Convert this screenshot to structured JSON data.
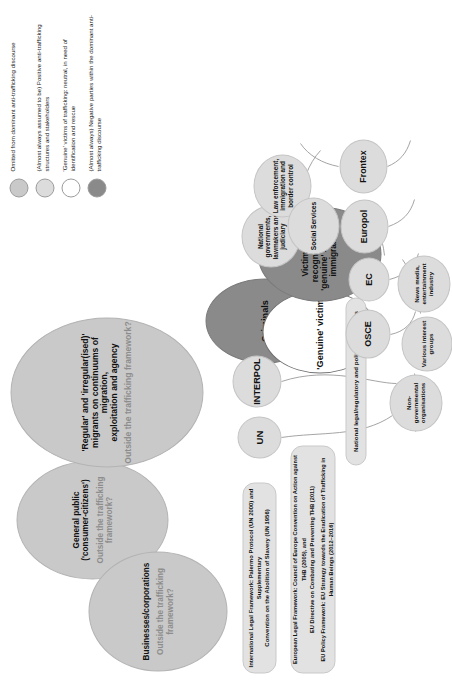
{
  "diagram": {
    "outside_nodes": [
      {
        "id": "general-public",
        "title": "General public\n('consumer-citizens')",
        "title_line1": "General public",
        "title_line2": "('consumer-citizens')",
        "subtitle_line1": "Outside the trafficking",
        "subtitle_line2": "framework?"
      },
      {
        "id": "businesses",
        "title_line1": "Businesses/corporations",
        "title_line2": "",
        "subtitle_line1": "Outside the trafficking",
        "subtitle_line2": "framework?"
      },
      {
        "id": "migrants",
        "title_line1": "'Regular' and 'irregular(ised)'",
        "title_line2": "migrants on continuums of migration,",
        "title_line3": "exploitation and agency",
        "subtitle_line1": "Outside the trafficking framework?"
      }
    ],
    "actor_nodes": {
      "criminals": "Criminals",
      "genuine_victims": "'Genuine' victims",
      "not_recognised_line1": "Victims not recognised as",
      "not_recognised_line2": "'genuine' = 'illegal'",
      "not_recognised_line3": "immigrants"
    },
    "framework_boxes": {
      "international_line1": "International Legal Framework: Palermo Protocol (UN 2000) and Supplementary",
      "international_line2": "Convention on the Abolition of Slavery (UN 1956)",
      "european_line1": "European Legal Framework: Council of Europe Convention on Action against THB (2005), and",
      "european_line2": "EU Directive on Combating and Preventing THB (2011)",
      "european_line3": "EU Policy Framework: EU Strategy towards the Eradication of Trafficking in Human Beings (2012–2016)",
      "national": "National legal/regulatory and policy frameworks"
    },
    "international_bodies": [
      {
        "id": "un",
        "label": "UN"
      },
      {
        "id": "interpol",
        "label": "INTERPOL"
      }
    ],
    "european_bodies": [
      {
        "id": "osce",
        "label": "OSCE"
      },
      {
        "id": "ec",
        "label": "EC"
      },
      {
        "id": "europol",
        "label": "Europol"
      },
      {
        "id": "frontex",
        "label": "Frontex"
      }
    ],
    "national_actors": [
      {
        "id": "national-governments",
        "line1": "National",
        "line2": "governments,",
        "line3": "lawmakers and",
        "line4": "judiciary"
      },
      {
        "id": "law-enforcement",
        "line1": "Law enforcement,",
        "line2": "immigration and",
        "line3": "border control"
      },
      {
        "id": "social-services",
        "line1": "Social Services",
        "line2": "",
        "line3": ""
      }
    ],
    "civil_actors": [
      {
        "id": "ngo",
        "line1": "Non-governmental",
        "line2": "organisations",
        "line3": ""
      },
      {
        "id": "interest-groups",
        "line1": "Various interest",
        "line2": "groups",
        "line3": ""
      },
      {
        "id": "news-media",
        "line1": "News media,",
        "line2": "entertainment",
        "line3": "industry"
      }
    ]
  },
  "legend": {
    "items": [
      {
        "color": "#c9c9c9",
        "text": "Omitted from dominant anti-trafficking discourse"
      },
      {
        "color": "#dcdcdc",
        "text": "(Almost always assumed to be) Positive anti-trafficking structures and stakeholders"
      },
      {
        "color": "#ffffff",
        "text": "'Genuine' victims of trafficking: neutral, in need of identification and rescue"
      },
      {
        "color": "#8a8a8a",
        "text": "(Almost always) Negative parties within the dominant anti-trafficking discourse"
      }
    ]
  }
}
